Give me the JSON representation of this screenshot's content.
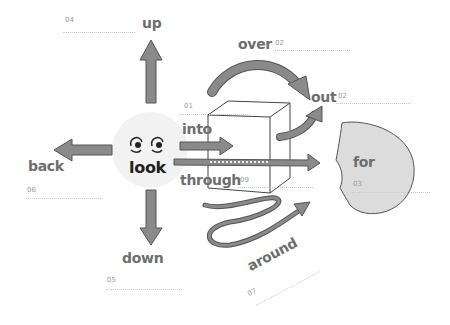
{
  "diagram": {
    "type": "prepositions-with-look",
    "center_word": "look",
    "colors": {
      "arrow_fill": "#8a8a8a",
      "arrow_stroke": "#555555",
      "face_bg": "#f2f2f2",
      "blob_fill": "#dcdcdc",
      "text_gray": "#6e6e6e",
      "text_dark": "#222222"
    },
    "labels": [
      {
        "word": "up",
        "number": "04"
      },
      {
        "word": "over",
        "number": "08"
      },
      {
        "word": "out",
        "number": "02"
      },
      {
        "word": "into",
        "number": "01"
      },
      {
        "word": "for",
        "number": "03"
      },
      {
        "word": "back",
        "number": "06"
      },
      {
        "word": "through",
        "number": "09"
      },
      {
        "word": "down",
        "number": "05"
      },
      {
        "word": "around",
        "number": "07"
      }
    ]
  }
}
